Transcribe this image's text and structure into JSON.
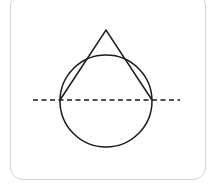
{
  "canvas": {
    "width": 216,
    "height": 192,
    "background_color": "#ffffff"
  },
  "card": {
    "name": "rounded-card-panel",
    "x": 10,
    "y": -8,
    "width": 196,
    "height": 188,
    "corner_radius": 13,
    "fill_color": "#ffffff",
    "border_color": "#d2d2d2",
    "border_width": 1.5
  },
  "figure": {
    "name": "teardrop-with-axis-diagram",
    "stroke_color": "#1a1a1a",
    "stroke_width": 1.5,
    "fill": "none",
    "circle": {
      "name": "circle-lower-lobe",
      "center_x": 106,
      "center_y": 101,
      "radius": 46
    },
    "triangle": {
      "name": "triangle-upper-point",
      "apex_x": 106,
      "apex_y": 30,
      "left_x": 60,
      "left_y": 100,
      "right_x": 152,
      "right_y": 100
    },
    "dashed_line": {
      "name": "horizontal-dashed-axis",
      "x1": 33,
      "y1": 100,
      "x2": 180,
      "y2": 100,
      "dash_length": 5,
      "gap_length": 3.5,
      "stroke_color": "#1a1a1a",
      "stroke_width": 1.6
    }
  },
  "chart_data": {
    "type": "diagram",
    "title": "",
    "shapes": [
      {
        "shape": "circle",
        "label": "lower circular lobe",
        "cx": 106,
        "cy": 101,
        "r": 46
      },
      {
        "shape": "triangle",
        "label": "upper pointed lobe",
        "points": [
          [
            106,
            30
          ],
          [
            60,
            100
          ],
          [
            152,
            100
          ]
        ]
      },
      {
        "shape": "dashed-line",
        "label": "horizontal bisecting axis",
        "points": [
          [
            33,
            100
          ],
          [
            180,
            100
          ]
        ]
      }
    ]
  }
}
